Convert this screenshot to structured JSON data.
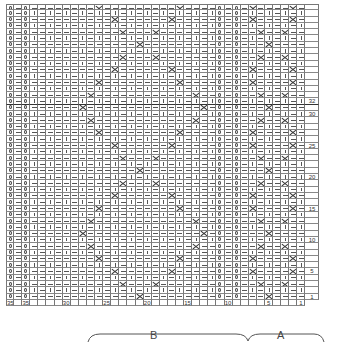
{
  "chart_title": "Knitting cable chart",
  "grid": {
    "columns": 37,
    "rows": 47,
    "numbered_rows_visible": 32,
    "column_numbers": [
      {
        "col": 37,
        "label": "35"
      },
      {
        "col": 35,
        "label": "35"
      },
      {
        "col": 30,
        "label": "30"
      },
      {
        "col": 25,
        "label": "25"
      },
      {
        "col": 20,
        "label": "20"
      },
      {
        "col": 15,
        "label": "15"
      },
      {
        "col": 10,
        "label": "10"
      },
      {
        "col": 5,
        "label": "5"
      },
      {
        "col": 1,
        "label": "1"
      }
    ],
    "row_numbers": [
      {
        "row": 32,
        "label": "32"
      },
      {
        "row": 30,
        "label": "30"
      },
      {
        "row": 25,
        "label": "25"
      },
      {
        "row": 20,
        "label": "20"
      },
      {
        "row": 15,
        "label": "15"
      },
      {
        "row": 10,
        "label": "10"
      },
      {
        "row": 5,
        "label": "5"
      },
      {
        "row": 1,
        "label": "1"
      }
    ],
    "twisted_columns": [
      37,
      35,
      11,
      9
    ],
    "purl_columns": [
      36,
      10
    ],
    "symbols": {
      "k": "knit |",
      "p": "purl —",
      "tw": "twisted stitch Q",
      "x": "cross / cable"
    }
  },
  "cross_positions": [
    {
      "row": 1,
      "cols": [
        21,
        5
      ]
    },
    {
      "row": 3,
      "cols": [
        23,
        19,
        6,
        3
      ]
    },
    {
      "row": 5,
      "cols": [
        24,
        17,
        7,
        2
      ]
    },
    {
      "row": 7,
      "cols": [
        26,
        16,
        7,
        2
      ]
    },
    {
      "row": 9,
      "cols": [
        27,
        14,
        6,
        3
      ]
    },
    {
      "row": 11,
      "cols": [
        28,
        13,
        5
      ]
    },
    {
      "row": 13,
      "cols": [
        27,
        14,
        6,
        3
      ]
    },
    {
      "row": 15,
      "cols": [
        26,
        16,
        7,
        2
      ]
    },
    {
      "row": 17,
      "cols": [
        24,
        17,
        7,
        2
      ]
    },
    {
      "row": 19,
      "cols": [
        23,
        19,
        6,
        3
      ]
    },
    {
      "row": 21,
      "cols": [
        21,
        5
      ]
    },
    {
      "row": 23,
      "cols": [
        23,
        19,
        6,
        3
      ]
    },
    {
      "row": 25,
      "cols": [
        24,
        17,
        7,
        2
      ]
    },
    {
      "row": 27,
      "cols": [
        26,
        16,
        7,
        2
      ]
    },
    {
      "row": 29,
      "cols": [
        27,
        14,
        6,
        3
      ]
    },
    {
      "row": 31,
      "cols": [
        28,
        13,
        5
      ]
    },
    {
      "row": 33,
      "cols": [
        27,
        14,
        6,
        3
      ]
    },
    {
      "row": 35,
      "cols": [
        26,
        16,
        7,
        2
      ]
    },
    {
      "row": 37,
      "cols": [
        24,
        17,
        7,
        2
      ]
    },
    {
      "row": 39,
      "cols": [
        23,
        19,
        6,
        3
      ]
    },
    {
      "row": 41,
      "cols": [
        21,
        5
      ]
    },
    {
      "row": 43,
      "cols": [
        23,
        19,
        6,
        3
      ]
    },
    {
      "row": 45,
      "cols": [
        24,
        17,
        7,
        2
      ]
    },
    {
      "row": 47,
      "cols": [
        26,
        16,
        7,
        2
      ]
    }
  ],
  "brace_labels": {
    "b": "B",
    "a": "A"
  },
  "colors": {
    "grid": "#777777",
    "ink": "#333333",
    "background": "#ffffff"
  }
}
